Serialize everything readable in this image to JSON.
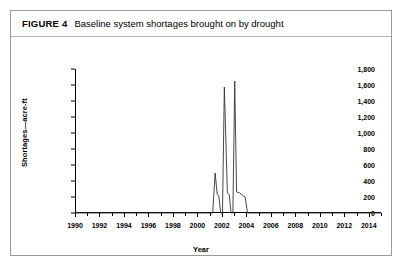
{
  "figure": {
    "label": "FIGURE 4",
    "caption": "Baseline system shortages brought on by drought"
  },
  "chart_data": {
    "type": "line",
    "title": "Baseline system shortages brought on by drought",
    "xlabel": "Year",
    "ylabel": "Shortages—acre-ft",
    "xlim": [
      1990,
      2015
    ],
    "ylim": [
      0,
      1800
    ],
    "grid": false,
    "legend": "none",
    "xticks": [
      1990,
      1992,
      1994,
      1996,
      1998,
      2000,
      2002,
      2004,
      2006,
      2008,
      2010,
      2012,
      2014
    ],
    "xtick_labels": [
      "1990",
      "1992",
      "1994",
      "1996",
      "1998",
      "2000",
      "2002",
      "2004",
      "2006",
      "2008",
      "2010",
      "2012",
      "2014"
    ],
    "xminor_ticks": [
      1991,
      1993,
      1995,
      1997,
      1999,
      2001,
      2003,
      2005,
      2007,
      2009,
      2011,
      2013,
      2015
    ],
    "yticks": [
      0,
      200,
      400,
      600,
      800,
      1000,
      1200,
      1400,
      1600,
      1800
    ],
    "ytick_labels": [
      "0",
      "200",
      "400",
      "600",
      "800",
      "1,000",
      "1,200",
      "1,400",
      "1,600",
      "1,800"
    ],
    "series": [
      {
        "name": "Baseline system shortages",
        "color": "#333333",
        "x": [
          1990,
          2001.25,
          2001.45,
          2001.62,
          2001.75,
          2001.9,
          2002.05,
          2002.2,
          2002.45,
          2002.6,
          2002.75,
          2002.9,
          2003.05,
          2003.2,
          2003.45,
          2003.6,
          2003.75,
          2003.9,
          2004.1,
          2004.3,
          2015
        ],
        "values": [
          0,
          0,
          500,
          230,
          215,
          0,
          0,
          1575,
          250,
          230,
          0,
          0,
          1650,
          265,
          250,
          235,
          215,
          200,
          0,
          0,
          0
        ]
      }
    ],
    "annotations": []
  }
}
